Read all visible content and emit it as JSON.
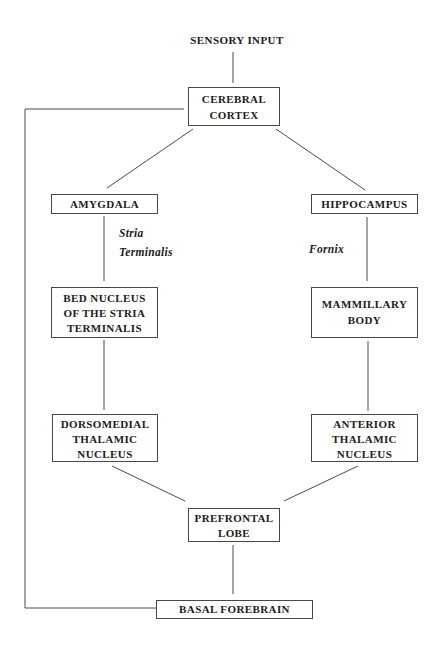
{
  "diagram": {
    "nodes": {
      "sensory_input": "SENSORY INPUT",
      "cerebral_cortex": "CEREBRAL\nCORTEX",
      "amygdala": "AMYGDALA",
      "hippocampus": "HIPPOCAMPUS",
      "bed_nucleus": "BED NUCLEUS\nOF THE STRIA\nTERMINALIS",
      "mammillary_body": "MAMMILLARY\nBODY",
      "dorsomedial_thalamic_nucleus": "DORSOMEDIAL\nTHALAMIC\nNUCLEUS",
      "anterior_thalamic_nucleus": "ANTERIOR\nTHALAMIC\nNUCLEUS",
      "prefrontal_lobe": "PREFRONTAL\nLOBE",
      "basal_forebrain": "BASAL FOREBRAIN"
    },
    "edge_labels": {
      "stria_terminalis": "Stria\nTerminalis",
      "fornix": "Fornix"
    },
    "edges": [
      {
        "from": "SENSORY INPUT",
        "to": "CEREBRAL CORTEX"
      },
      {
        "from": "CEREBRAL CORTEX",
        "to": "AMYGDALA"
      },
      {
        "from": "CEREBRAL CORTEX",
        "to": "HIPPOCAMPUS"
      },
      {
        "from": "AMYGDALA",
        "to": "BED NUCLEUS OF THE STRIA TERMINALIS",
        "label": "Stria Terminalis"
      },
      {
        "from": "HIPPOCAMPUS",
        "to": "MAMMILLARY BODY",
        "label": "Fornix"
      },
      {
        "from": "BED NUCLEUS OF THE STRIA TERMINALIS",
        "to": "DORSOMEDIAL THALAMIC NUCLEUS"
      },
      {
        "from": "MAMMILLARY BODY",
        "to": "ANTERIOR THALAMIC NUCLEUS"
      },
      {
        "from": "DORSOMEDIAL THALAMIC NUCLEUS",
        "to": "PREFRONTAL LOBE"
      },
      {
        "from": "ANTERIOR THALAMIC NUCLEUS",
        "to": "PREFRONTAL LOBE"
      },
      {
        "from": "PREFRONTAL LOBE",
        "to": "BASAL FOREBRAIN"
      },
      {
        "from": "BASAL FOREBRAIN",
        "to": "CEREBRAL CORTEX"
      }
    ],
    "colors": {
      "background": "#ffffff",
      "text": "#1b1b1b",
      "line": "#4a4a4a",
      "box_border": "#474747"
    }
  }
}
